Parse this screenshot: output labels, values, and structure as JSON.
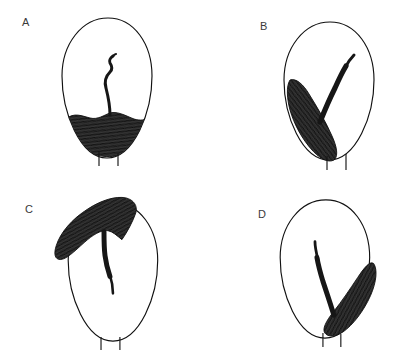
{
  "figure": {
    "type": "scientific-line-drawing",
    "background_color": "#ffffff",
    "ink_color": "#1a1a1a",
    "mass_fill_color": "#262626",
    "outline_color": "#111111",
    "label_color": "#3a3a3a",
    "panel_count": 4,
    "clipped_header_text": ""
  },
  "panels": [
    {
      "label": "A",
      "label_x": 22,
      "label_y": 17,
      "description": "Egg-shaped outline with dark textured mass pooled across the lower third and a slender sigmoid stalk rising from its centre toward the upper interior.",
      "mass_position": "bottom-centre",
      "stalk_direction": "vertical-up",
      "mass_outside_outline": false,
      "legs": 2
    },
    {
      "label": "B",
      "label_x": 260,
      "label_y": 21,
      "description": "Egg-shaped outline with an elongate dark lobe filling the lower-left quadrant and a narrow tapering stalk extending up and to the right.",
      "mass_position": "lower-left",
      "stalk_direction": "upper-right",
      "mass_outside_outline": true,
      "legs": 2
    },
    {
      "label": "C",
      "label_x": 25,
      "label_y": 204,
      "description": "Egg-shaped outline with a broad boomerang-shaped dark mass draped over the upper-left margin, projecting beyond the outline, with a tapering stalk descending into the interior.",
      "mass_position": "upper-left",
      "stalk_direction": "down-centre",
      "mass_outside_outline": true,
      "legs": 2
    },
    {
      "label": "D",
      "label_x": 258,
      "label_y": 209,
      "description": "Egg-shaped outline with a curved dark lobe hugging the lower-right margin, extending past the outline, and a slender stalk running up and to the left.",
      "mass_position": "lower-right",
      "stalk_direction": "upper-left",
      "mass_outside_outline": true,
      "legs": 2
    }
  ]
}
